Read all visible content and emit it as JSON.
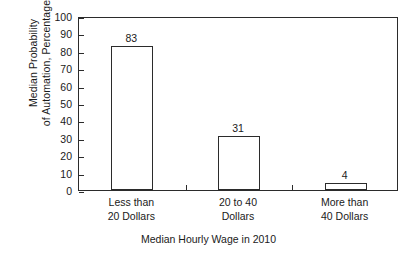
{
  "chart_data": {
    "type": "bar",
    "title": "",
    "xlabel": "Median Hourly Wage in 2010",
    "ylabel_line1": "Median Probability",
    "ylabel_line2": "of Automation, Percentage",
    "categories": [
      {
        "line1": "Less than",
        "line2": "20 Dollars"
      },
      {
        "line1": "20 to 40",
        "line2": "Dollars"
      },
      {
        "line1": "More than",
        "line2": "40 Dollars"
      }
    ],
    "category_names": [
      "Less than 20 Dollars",
      "20 to 40 Dollars",
      "More than 40 Dollars"
    ],
    "values": [
      83,
      31,
      4
    ],
    "value_labels": [
      "83",
      "31",
      "4"
    ],
    "ylim": [
      0,
      100
    ],
    "ytick_values": [
      0,
      10,
      20,
      30,
      40,
      50,
      60,
      70,
      80,
      90,
      100
    ],
    "ytick_labels": [
      "0",
      "10",
      "20",
      "30",
      "40",
      "50",
      "60",
      "70",
      "80",
      "90",
      "100"
    ],
    "grid": false,
    "legend": false,
    "bar_fill_color": "#ffffff",
    "bar_edge_color": "#2b2b2b",
    "axis_color": "#2b2b2b",
    "background_color": "#ffffff"
  }
}
